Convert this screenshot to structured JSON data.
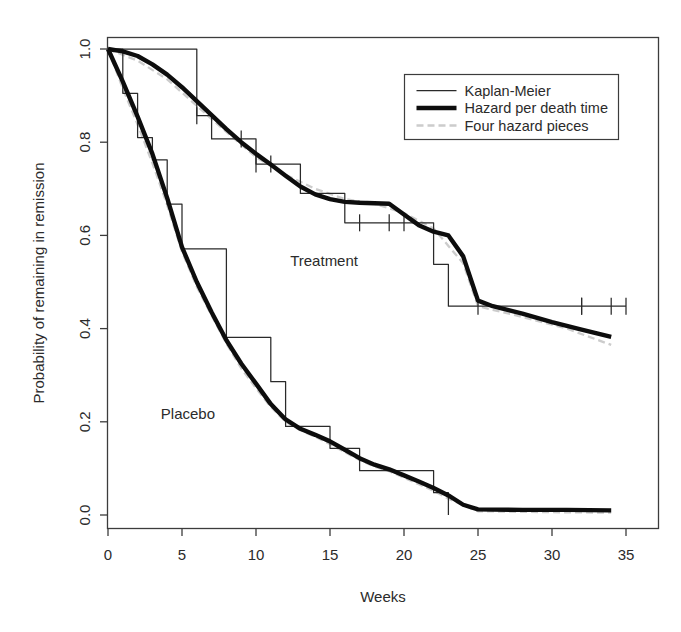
{
  "chart_data": {
    "type": "line",
    "title": "",
    "xlabel": "Weeks",
    "ylabel": "Probability of remaining in remission",
    "xlim": [
      0,
      35
    ],
    "ylim": [
      0.0,
      1.0
    ],
    "xticks": [
      0,
      5,
      10,
      15,
      20,
      25,
      30,
      35
    ],
    "xticklabels": [
      "0",
      "5",
      "10",
      "15",
      "20",
      "25",
      "30",
      "35"
    ],
    "yticks": [
      0.0,
      0.2,
      0.4,
      0.6,
      0.8,
      1.0
    ],
    "yticklabels": [
      "0.0",
      "0.2",
      "0.4",
      "0.6",
      "0.8",
      "1.0"
    ],
    "grid": false,
    "frame": true,
    "legend": {
      "position": "top-right",
      "entries": [
        {
          "label": "Kaplan-Meier",
          "style": "thin-solid",
          "color": "#111111",
          "width": 1.2
        },
        {
          "label": "Hazard per death time",
          "style": "thick-solid",
          "color": "#0d0d0d",
          "width": 4.2
        },
        {
          "label": "Four hazard pieces",
          "style": "light-dashed",
          "color": "#c9c9c9",
          "width": 2.2
        }
      ]
    },
    "group_annotations": [
      {
        "text": "Treatment",
        "x": 14.6,
        "y": 0.535
      },
      {
        "text": "Placebo",
        "x": 5.4,
        "y": 0.205
      }
    ],
    "series": [
      {
        "name": "Treatment Kaplan-Meier",
        "group": "Treatment",
        "style": "thin-solid",
        "steps": [
          {
            "t": 0,
            "s": 1.0
          },
          {
            "t": 6,
            "s": 0.857
          },
          {
            "t": 7,
            "s": 0.807
          },
          {
            "t": 10,
            "s": 0.753
          },
          {
            "t": 13,
            "s": 0.69
          },
          {
            "t": 16,
            "s": 0.627
          },
          {
            "t": 22,
            "s": 0.538
          },
          {
            "t": 23,
            "s": 0.448
          },
          {
            "t": 35,
            "s": 0.448
          }
        ],
        "censored": [
          6,
          9,
          10,
          11,
          17,
          19,
          20,
          25,
          32,
          32,
          34,
          35
        ]
      },
      {
        "name": "Placebo Kaplan-Meier",
        "group": "Placebo",
        "style": "thin-solid",
        "steps": [
          {
            "t": 0,
            "s": 1.0
          },
          {
            "t": 1,
            "s": 0.905
          },
          {
            "t": 2,
            "s": 0.81
          },
          {
            "t": 3,
            "s": 0.762
          },
          {
            "t": 4,
            "s": 0.667
          },
          {
            "t": 5,
            "s": 0.571
          },
          {
            "t": 8,
            "s": 0.381
          },
          {
            "t": 11,
            "s": 0.286
          },
          {
            "t": 12,
            "s": 0.19
          },
          {
            "t": 15,
            "s": 0.143
          },
          {
            "t": 17,
            "s": 0.095
          },
          {
            "t": 22,
            "s": 0.048
          },
          {
            "t": 23,
            "s": 0.0
          }
        ],
        "censored": []
      },
      {
        "name": "Treatment hazard per death time",
        "group": "Treatment",
        "style": "thick-solid",
        "points": [
          {
            "t": 0,
            "s": 1.0
          },
          {
            "t": 1,
            "s": 0.995
          },
          {
            "t": 2,
            "s": 0.985
          },
          {
            "t": 3,
            "s": 0.967
          },
          {
            "t": 4,
            "s": 0.945
          },
          {
            "t": 5,
            "s": 0.918
          },
          {
            "t": 6,
            "s": 0.888
          },
          {
            "t": 7,
            "s": 0.858
          },
          {
            "t": 8,
            "s": 0.828
          },
          {
            "t": 9,
            "s": 0.8
          },
          {
            "t": 10,
            "s": 0.775
          },
          {
            "t": 11,
            "s": 0.752
          },
          {
            "t": 12,
            "s": 0.728
          },
          {
            "t": 13,
            "s": 0.705
          },
          {
            "t": 14,
            "s": 0.688
          },
          {
            "t": 15,
            "s": 0.678
          },
          {
            "t": 16,
            "s": 0.672
          },
          {
            "t": 17,
            "s": 0.67
          },
          {
            "t": 18,
            "s": 0.669
          },
          {
            "t": 19,
            "s": 0.668
          },
          {
            "t": 20,
            "s": 0.645
          },
          {
            "t": 21,
            "s": 0.622
          },
          {
            "t": 22,
            "s": 0.608
          },
          {
            "t": 23,
            "s": 0.6
          },
          {
            "t": 24,
            "s": 0.555
          },
          {
            "t": 25,
            "s": 0.46
          },
          {
            "t": 26,
            "s": 0.448
          },
          {
            "t": 28,
            "s": 0.432
          },
          {
            "t": 30,
            "s": 0.414
          },
          {
            "t": 32,
            "s": 0.398
          },
          {
            "t": 34,
            "s": 0.382
          }
        ]
      },
      {
        "name": "Placebo hazard per death time",
        "group": "Placebo",
        "style": "thick-solid",
        "points": [
          {
            "t": 0,
            "s": 1.0
          },
          {
            "t": 1,
            "s": 0.93
          },
          {
            "t": 2,
            "s": 0.855
          },
          {
            "t": 3,
            "s": 0.775
          },
          {
            "t": 4,
            "s": 0.68
          },
          {
            "t": 5,
            "s": 0.575
          },
          {
            "t": 6,
            "s": 0.5
          },
          {
            "t": 7,
            "s": 0.435
          },
          {
            "t": 8,
            "s": 0.375
          },
          {
            "t": 9,
            "s": 0.325
          },
          {
            "t": 10,
            "s": 0.282
          },
          {
            "t": 11,
            "s": 0.238
          },
          {
            "t": 12,
            "s": 0.205
          },
          {
            "t": 13,
            "s": 0.185
          },
          {
            "t": 14,
            "s": 0.172
          },
          {
            "t": 15,
            "s": 0.158
          },
          {
            "t": 16,
            "s": 0.14
          },
          {
            "t": 17,
            "s": 0.122
          },
          {
            "t": 18,
            "s": 0.108
          },
          {
            "t": 19,
            "s": 0.098
          },
          {
            "t": 20,
            "s": 0.085
          },
          {
            "t": 21,
            "s": 0.072
          },
          {
            "t": 22,
            "s": 0.058
          },
          {
            "t": 23,
            "s": 0.042
          },
          {
            "t": 24,
            "s": 0.022
          },
          {
            "t": 25,
            "s": 0.012
          },
          {
            "t": 28,
            "s": 0.011
          },
          {
            "t": 31,
            "s": 0.011
          },
          {
            "t": 34,
            "s": 0.01
          }
        ]
      },
      {
        "name": "Treatment four hazard pieces",
        "group": "Treatment",
        "style": "light-dashed",
        "points": [
          {
            "t": 0,
            "s": 1.0
          },
          {
            "t": 2,
            "s": 0.975
          },
          {
            "t": 4,
            "s": 0.935
          },
          {
            "t": 6,
            "s": 0.878
          },
          {
            "t": 8,
            "s": 0.822
          },
          {
            "t": 10,
            "s": 0.768
          },
          {
            "t": 12,
            "s": 0.73
          },
          {
            "t": 14,
            "s": 0.7
          },
          {
            "t": 16,
            "s": 0.678
          },
          {
            "t": 18,
            "s": 0.668
          },
          {
            "t": 20,
            "s": 0.648
          },
          {
            "t": 22,
            "s": 0.615
          },
          {
            "t": 24,
            "s": 0.54
          },
          {
            "t": 25,
            "s": 0.448
          },
          {
            "t": 28,
            "s": 0.425
          },
          {
            "t": 31,
            "s": 0.4
          },
          {
            "t": 34,
            "s": 0.365
          }
        ]
      },
      {
        "name": "Placebo four hazard pieces",
        "group": "Placebo",
        "style": "light-dashed",
        "points": [
          {
            "t": 0,
            "s": 1.0
          },
          {
            "t": 1,
            "s": 0.915
          },
          {
            "t": 2,
            "s": 0.838
          },
          {
            "t": 3,
            "s": 0.755
          },
          {
            "t": 4,
            "s": 0.665
          },
          {
            "t": 5,
            "s": 0.565
          },
          {
            "t": 6,
            "s": 0.49
          },
          {
            "t": 7,
            "s": 0.428
          },
          {
            "t": 8,
            "s": 0.368
          },
          {
            "t": 9,
            "s": 0.315
          },
          {
            "t": 10,
            "s": 0.272
          },
          {
            "t": 11,
            "s": 0.232
          },
          {
            "t": 12,
            "s": 0.2
          },
          {
            "t": 13,
            "s": 0.182
          },
          {
            "t": 14,
            "s": 0.168
          },
          {
            "t": 15,
            "s": 0.152
          },
          {
            "t": 16,
            "s": 0.135
          },
          {
            "t": 17,
            "s": 0.118
          },
          {
            "t": 18,
            "s": 0.104
          },
          {
            "t": 19,
            "s": 0.094
          },
          {
            "t": 20,
            "s": 0.08
          },
          {
            "t": 21,
            "s": 0.066
          },
          {
            "t": 22,
            "s": 0.052
          },
          {
            "t": 23,
            "s": 0.035
          },
          {
            "t": 25,
            "s": 0.008
          },
          {
            "t": 30,
            "s": 0.006
          },
          {
            "t": 34,
            "s": 0.005
          }
        ]
      }
    ]
  }
}
